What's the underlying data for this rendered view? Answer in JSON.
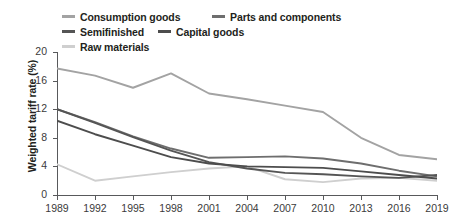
{
  "chart_data": {
    "type": "line",
    "title": "",
    "xlabel": "",
    "ylabel": "Weighted tariff rate (%)",
    "xlim": [
      1989,
      2019
    ],
    "ylim": [
      0,
      20
    ],
    "yticks": [
      0,
      4,
      8,
      12,
      16,
      20
    ],
    "xticks": [
      1989,
      1992,
      1995,
      1998,
      2001,
      2004,
      2007,
      2010,
      2013,
      2016,
      2019
    ],
    "grid": false,
    "legend_position": "top",
    "x": [
      1989,
      1992,
      1995,
      1998,
      2001,
      2004,
      2007,
      2010,
      2013,
      2016,
      2019
    ],
    "series": [
      {
        "name": "Consumption goods",
        "color": "#a3a3a3",
        "values": [
          17.7,
          16.7,
          15.0,
          17.0,
          14.2,
          13.4,
          12.5,
          11.6,
          8.0,
          5.6,
          5.0
        ]
      },
      {
        "name": "Capital goods",
        "color": "#4d4d4d",
        "values": [
          10.4,
          8.5,
          6.9,
          5.3,
          4.4,
          4.0,
          3.9,
          3.8,
          3.3,
          2.8,
          2.3
        ]
      },
      {
        "name": "Parts and components",
        "color": "#6e6e6e",
        "values": [
          12.0,
          10.2,
          8.2,
          6.5,
          5.2,
          5.3,
          5.4,
          5.1,
          4.4,
          3.4,
          2.6
        ]
      },
      {
        "name": "Semifinished",
        "color": "#555555",
        "values": [
          12.0,
          10.1,
          8.1,
          6.2,
          4.6,
          3.7,
          3.1,
          2.9,
          2.6,
          2.4,
          2.8
        ]
      },
      {
        "name": "Raw materials",
        "color": "#cfcfcf",
        "values": [
          4.3,
          2.0,
          2.6,
          3.2,
          3.7,
          4.0,
          2.2,
          1.8,
          2.3,
          2.4,
          2.0
        ]
      }
    ]
  },
  "legend": {
    "items": [
      {
        "label": "Consumption goods",
        "color": "#a3a3a3"
      },
      {
        "label": "Parts and components",
        "color": "#6e6e6e"
      },
      {
        "label": "Semifinished",
        "color": "#555555"
      },
      {
        "label": "Capital goods",
        "color": "#4d4d4d"
      },
      {
        "label": "Raw materials",
        "color": "#cfcfcf"
      }
    ]
  },
  "axes": {
    "y_title": "Weighted tariff rate (%)",
    "y_labels": [
      "20",
      "16",
      "12",
      "8",
      "4",
      "0"
    ],
    "x_labels": [
      "1989",
      "1992",
      "1995",
      "1998",
      "2001",
      "2004",
      "2007",
      "2010",
      "2013",
      "2016",
      "2019"
    ]
  }
}
